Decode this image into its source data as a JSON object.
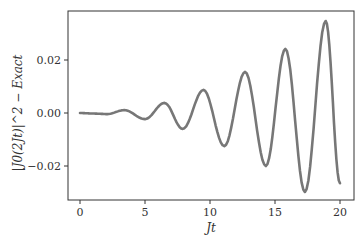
{
  "chart_data": {
    "type": "line",
    "title": "",
    "xlabel": "Jt",
    "ylabel": "|J0(2Jt)|^2 − Exact",
    "xlim": [
      -1,
      21
    ],
    "ylim": [
      -0.033,
      0.038
    ],
    "grid": false,
    "legend": null,
    "xticks": [
      "0",
      "5",
      "10",
      "15",
      "20"
    ],
    "yticks": [
      "−0.02",
      "0.00",
      "0.02"
    ],
    "line_color": "#777777",
    "series": [
      {
        "name": "difference",
        "x": [
          0,
          1.0,
          2.1,
          3.4,
          5.0,
          6.5,
          7.9,
          9.5,
          11.1,
          12.7,
          14.3,
          15.8,
          17.3,
          18.9,
          20.0
        ],
        "values": [
          0.0,
          -0.0002,
          -0.0004,
          0.0011,
          -0.0023,
          0.0038,
          -0.006,
          0.0087,
          -0.0125,
          0.0155,
          -0.02,
          0.0242,
          -0.0298,
          0.0347,
          -0.0265
        ]
      }
    ]
  }
}
